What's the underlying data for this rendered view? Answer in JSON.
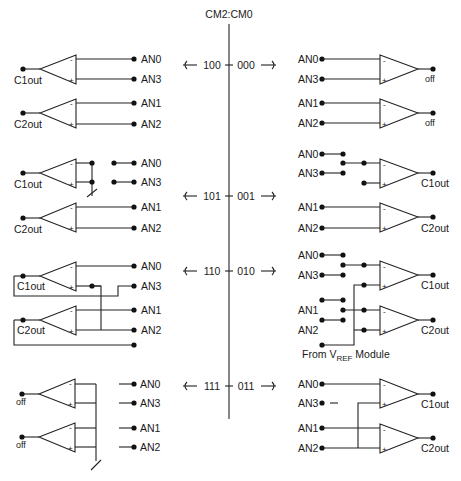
{
  "title": "CM2:CM0",
  "modes": {
    "left": [
      {
        "code": "100",
        "y": 65
      },
      {
        "code": "101",
        "y": 196
      },
      {
        "code": "110",
        "y": 271
      },
      {
        "code": "111",
        "y": 386
      }
    ],
    "right": [
      {
        "code": "000",
        "y": 65
      },
      {
        "code": "001",
        "y": 196
      },
      {
        "code": "010",
        "y": 271
      },
      {
        "code": "011",
        "y": 386
      }
    ]
  },
  "labels": {
    "an0": "AN0",
    "an1": "AN1",
    "an2": "AN2",
    "an3": "AN3",
    "c1out": "C1out",
    "c2out": "C2out",
    "off": "off",
    "minus": "-",
    "plus": "+",
    "vref_prefix": "From V",
    "vref_sub": "REF",
    "vref_suffix": " Module"
  },
  "sections": {
    "m100": {
      "c1_out": "C1out",
      "c2_out": "C2out",
      "inputs": [
        "AN0",
        "AN3",
        "AN1",
        "AN2"
      ]
    },
    "m101": {
      "c1_out": "C1out",
      "c2_out": "C2out",
      "inputs": [
        "AN0",
        "AN3",
        "AN1",
        "AN2"
      ]
    },
    "m110": {
      "c1_out": "C1out",
      "c2_out": "C2out",
      "inputs": [
        "AN0",
        "AN3",
        "AN1",
        "AN2"
      ]
    },
    "m111": {
      "c1_out": "off",
      "c2_out": "off",
      "inputs": [
        "AN0",
        "AN3",
        "AN1",
        "AN2"
      ]
    },
    "m000": {
      "c1_out": "off",
      "c2_out": "off",
      "inputs": [
        "AN0",
        "AN3",
        "AN1",
        "AN2"
      ]
    },
    "m001": {
      "c1_out": "C1out",
      "c2_out": "C2out",
      "inputs": [
        "AN0",
        "AN3",
        "AN1",
        "AN2"
      ]
    },
    "m010": {
      "c1_out": "C1out",
      "c2_out": "C2out",
      "inputs": [
        "AN0",
        "AN3",
        "AN1",
        "AN2"
      ]
    },
    "m011": {
      "c1_out": "C1out",
      "c2_out": "C2out",
      "inputs": [
        "AN0",
        "AN3",
        "AN1",
        "AN2"
      ]
    }
  }
}
